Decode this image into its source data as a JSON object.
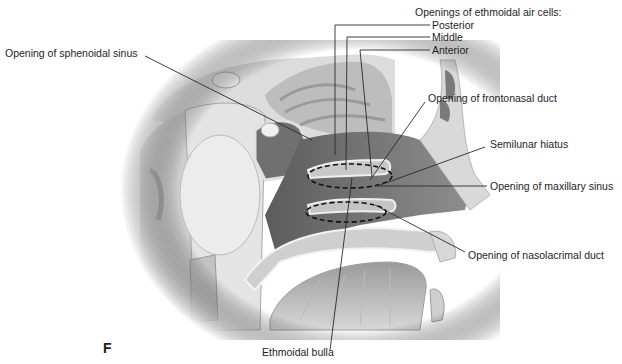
{
  "figure": {
    "panel_letter": "F",
    "labels": {
      "ethmoid_heading": "Openings of ethmoidal air cells:",
      "posterior": "Posterior",
      "middle": "Middle",
      "anterior": "Anterior",
      "sphenoidal": "Opening of sphenoidal sinus",
      "frontonasal": "Opening of frontonasal duct",
      "semilunar": "Semilunar hiatus",
      "maxillary": "Opening of maxillary sinus",
      "nasolacrimal": "Opening of nasolacrimal duct",
      "bulla": "Ethmoidal bulla"
    },
    "colors": {
      "background": "#ffffff",
      "text": "#1e1e1e",
      "leader_line": "#2a2a2a",
      "cavity_dark": "#6e6e6e",
      "tissue_mid": "#a8a8a8",
      "tissue_light": "#d4d4d4",
      "bone": "#e6e6e6"
    }
  }
}
